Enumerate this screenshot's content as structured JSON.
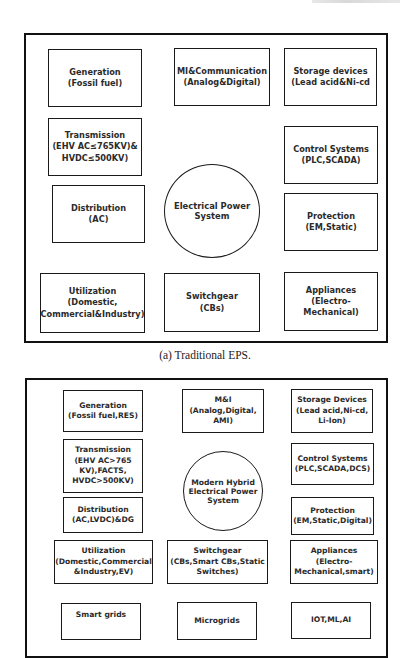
{
  "figure_a": {
    "center": "Electrical Power\nSystem",
    "boxes": {
      "generation": "Generation\n(Fossil fuel)",
      "mi_comm": "MI&Communication\n(Analog&Digital)",
      "storage": "Storage devices\n(Lead acid&Ni-cd",
      "transmission": "Transmission\n(EHV AC≤765KV)&\nHVDC≤500KV)",
      "control": "Control Systems\n(PLC,SCADA)",
      "distribution": "Distribution\n(AC)",
      "protection": "Protection\n(EM,Static)",
      "utilization": "Utilization\n(Domestic,\nCommercial&Industry)",
      "switchgear": "Switchgear\n(CBs)",
      "appliances": "Appliances\n(Electro-\nMechanical)"
    },
    "caption": "(a) Traditional EPS."
  },
  "figure_b": {
    "center": "Modern Hybrid\nElectrical Power\nSystem",
    "boxes": {
      "generation": "Generation\n(Fossil fuel,RES)",
      "mi": "M&I\n(Analog,Digital,\nAMI)",
      "storage": "Storage Devices\n(Lead acid,Ni-cd,\nLi-Ion)",
      "transmission": "Transmission\n(EHV AC>765\nKV),FACTS,\nHVDC>500KV)",
      "control": "Control Systems\n(PLC,SCADA,DCS)",
      "distribution": "Distribution\n(AC,LVDC)&DG",
      "protection": "Protection\n(EM,Static,Digital)",
      "utilization": "Utilization\n(Domestic,Commercial\n&Industry,EV)",
      "switchgear": "Switchgear\n(CBs,Smart CBs,Static\nSwitches)",
      "appliances": "Appliances\n(Electro-\nMechanical,smart)",
      "smart_grids": "Smart grids",
      "microgrids": "Microgrids",
      "iot": "IOT,ML,AI"
    }
  }
}
